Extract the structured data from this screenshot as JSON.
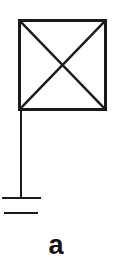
{
  "figure": {
    "caption": "a",
    "background_color": "#ffffff",
    "stroke_color": "#1a1a1a",
    "label_color": "#131313",
    "diagram_type": "schematic-symbol",
    "description_name": "antenna-with-crossed-square-and-ground",
    "elements": {
      "square": {
        "name": "crossed-square",
        "x": 19.5,
        "y": 20.5,
        "width": 86,
        "height": 89,
        "stroke_width": 2.6
      },
      "diagonal_primary": {
        "name": "diagonal-top-left-to-bottom-right",
        "x1": 19.5,
        "y1": 20.5,
        "x2": 105.5,
        "y2": 109.5,
        "stroke_width": 2.4
      },
      "diagonal_secondary": {
        "name": "diagonal-top-right-to-bottom-left",
        "x1": 105.5,
        "y1": 20.5,
        "x2": 19.5,
        "y2": 109.5,
        "stroke_width": 2.4
      },
      "mast": {
        "name": "vertical-mast-line",
        "x1": 21,
        "y1": 109.5,
        "x2": 21,
        "y2": 198,
        "stroke_width": 2.6
      },
      "ground_bar_upper": {
        "name": "ground-bar-upper",
        "x1": 2,
        "y1": 198,
        "x2": 41,
        "y2": 198,
        "stroke_width": 2.8
      },
      "ground_bar_lower": {
        "name": "ground-bar-lower",
        "x1": 4,
        "y1": 213,
        "x2": 38,
        "y2": 213,
        "stroke_width": 2.8
      }
    }
  }
}
